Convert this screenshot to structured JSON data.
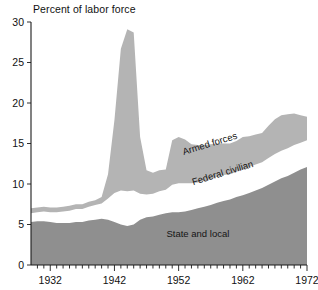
{
  "chart_data": {
    "type": "area",
    "stacked": true,
    "title": "Percent of labor force",
    "xlabel": "",
    "ylabel": "Percent of labor force",
    "xlim": [
      1929,
      1972
    ],
    "ylim": [
      0,
      30
    ],
    "ytick_labels": [
      "0",
      "5",
      "10",
      "15",
      "20",
      "25",
      "30"
    ],
    "ytick_values": [
      0,
      5,
      10,
      15,
      20,
      25,
      30
    ],
    "xtick_labels": [
      "1932",
      "1942",
      "1952",
      "1962",
      "1972"
    ],
    "xtick_values": [
      1932,
      1942,
      1952,
      1962,
      1972
    ],
    "minor_xtick_interval": 1,
    "grid": false,
    "legend_position": "inline-annotations",
    "annotations": [
      {
        "text": "Armed forces",
        "x": 1957,
        "y": 14.6,
        "rotation": -17
      },
      {
        "text": "Federal civilian",
        "x": 1959,
        "y": 11.0,
        "rotation": -17
      },
      {
        "text": "State and local",
        "x": 1955,
        "y": 3.4,
        "rotation": 0
      }
    ],
    "colors": {
      "armed_forces": "#b4b4b4",
      "federal_civilian": "#ffffff",
      "state_and_local": "#8f8f8f",
      "axis": "#1a1a1a",
      "background": "#ffffff",
      "text": "#111111"
    },
    "x": [
      1929,
      1930,
      1931,
      1932,
      1933,
      1934,
      1935,
      1936,
      1937,
      1938,
      1939,
      1940,
      1941,
      1942,
      1943,
      1944,
      1945,
      1946,
      1947,
      1948,
      1949,
      1950,
      1951,
      1952,
      1953,
      1954,
      1955,
      1956,
      1957,
      1958,
      1959,
      1960,
      1961,
      1962,
      1963,
      1964,
      1965,
      1966,
      1967,
      1968,
      1969,
      1970,
      1971,
      1972
    ],
    "series": [
      {
        "name": "State and local",
        "values": [
          5.3,
          5.4,
          5.4,
          5.3,
          5.2,
          5.2,
          5.2,
          5.3,
          5.3,
          5.5,
          5.6,
          5.7,
          5.6,
          5.3,
          5.0,
          4.8,
          5.0,
          5.6,
          5.9,
          6.0,
          6.2,
          6.4,
          6.5,
          6.5,
          6.6,
          6.8,
          7.0,
          7.2,
          7.4,
          7.7,
          7.9,
          8.1,
          8.4,
          8.6,
          8.9,
          9.2,
          9.5,
          9.9,
          10.3,
          10.7,
          11.0,
          11.4,
          11.8,
          12.1
        ]
      },
      {
        "name": "Federal civilian",
        "values": [
          1.1,
          1.1,
          1.2,
          1.2,
          1.3,
          1.4,
          1.5,
          1.6,
          1.6,
          1.7,
          1.8,
          1.9,
          2.6,
          3.6,
          4.2,
          4.3,
          4.2,
          3.2,
          2.8,
          2.8,
          2.9,
          2.9,
          3.4,
          3.6,
          3.5,
          3.3,
          3.2,
          3.2,
          3.2,
          3.2,
          3.2,
          3.1,
          3.1,
          3.2,
          3.2,
          3.2,
          3.2,
          3.3,
          3.4,
          3.4,
          3.4,
          3.4,
          3.3,
          3.3
        ]
      },
      {
        "name": "Armed forces",
        "values": [
          0.6,
          0.6,
          0.6,
          0.6,
          0.6,
          0.6,
          0.6,
          0.6,
          0.6,
          0.6,
          0.6,
          0.8,
          3.0,
          9.0,
          17.5,
          20.0,
          19.5,
          7.0,
          3.0,
          2.6,
          2.6,
          2.5,
          5.5,
          5.7,
          5.4,
          4.8,
          4.6,
          4.4,
          4.3,
          4.1,
          3.9,
          3.8,
          3.8,
          4.0,
          3.8,
          3.7,
          3.6,
          4.0,
          4.3,
          4.4,
          4.2,
          3.9,
          3.4,
          2.9
        ]
      }
    ]
  }
}
